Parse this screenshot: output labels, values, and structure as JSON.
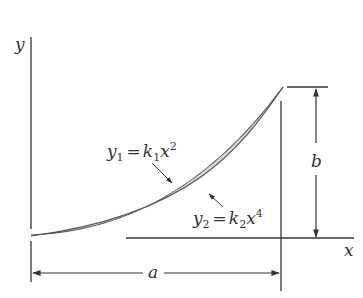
{
  "diagram": {
    "type": "area-between-curves",
    "axes": {
      "y_label": "y",
      "x_label": "x"
    },
    "curves": [
      {
        "id": "y1",
        "var": "y",
        "sub": "1",
        "eq": "=",
        "coef": "k",
        "coef_sub": "1",
        "base": "x",
        "exp": "2"
      },
      {
        "id": "y2",
        "var": "y",
        "sub": "2",
        "eq": "=",
        "coef": "k",
        "coef_sub": "2",
        "base": "x",
        "exp": "4"
      }
    ],
    "dimensions": {
      "width_label": "a",
      "height_label": "b"
    },
    "colors": {
      "fill": "#d9d9d9",
      "stroke": "#555555",
      "line": "#333333"
    }
  }
}
